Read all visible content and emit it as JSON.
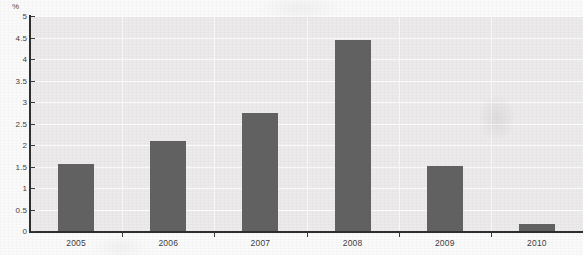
{
  "chart_data": {
    "type": "bar",
    "title": "",
    "subtitle": "",
    "xlabel": "",
    "ylabel": "%",
    "unit_label": "%",
    "categories": [
      "2005",
      "2006",
      "2007",
      "2008",
      "2009",
      "2010"
    ],
    "values": [
      1.57,
      2.1,
      2.75,
      4.45,
      1.52,
      0.17
    ],
    "series": [
      {
        "name": "",
        "values": [
          1.57,
          2.1,
          2.75,
          4.45,
          1.52,
          0.17
        ]
      }
    ],
    "ylim": [
      0,
      5
    ],
    "ytick_step": 0.5,
    "ytick_labels": [
      "0",
      "0.5",
      "1",
      "1.5",
      "2",
      "2.5",
      "3",
      "3.5",
      "4",
      "4.5",
      "5"
    ],
    "ytick_values": [
      0,
      0.5,
      1,
      1.5,
      2,
      2.5,
      3,
      3.5,
      4,
      4.5,
      5
    ],
    "grid": true,
    "grid_orientation": "horizontal",
    "legend": false,
    "legend_position": "none",
    "annotations": [],
    "colors": {
      "bar_fill": "#616161",
      "plot_background": "#eceaea",
      "gridline": "#fdfdfd",
      "axis_line": "#2e2e2e",
      "tick_label": "#3d3d3d",
      "page_background": "#fbfafa"
    }
  }
}
